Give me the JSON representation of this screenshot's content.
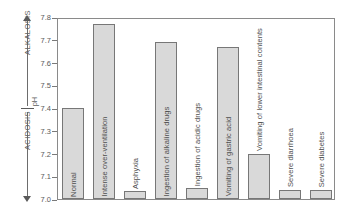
{
  "chart_data": {
    "type": "bar",
    "title": "",
    "xlabel": "",
    "ylabel": "pH",
    "ylim": [
      7.0,
      7.8
    ],
    "ytick_labels": [
      "7.8",
      "7.7",
      "7.6",
      "7.5",
      "7.4",
      "7.3",
      "7.2",
      "7.1",
      "7.0"
    ],
    "ytick_values": [
      7.8,
      7.7,
      7.6,
      7.5,
      7.4,
      7.3,
      7.2,
      7.1,
      7.0
    ],
    "grid": false,
    "legend": "none",
    "categories": [
      "Normal",
      "Intense over-ventilation",
      "Asphyxia",
      "Ingestion of alkaline drugs",
      "Ingestion of acidic drugs",
      "Vomiting of gastric acid",
      "Vomiting of lower intestinal contents",
      "Severe diarrhoea",
      "Severe diabetes"
    ],
    "values": [
      7.4,
      7.77,
      7.035,
      7.69,
      7.048,
      7.67,
      7.2,
      7.04,
      7.04
    ],
    "annotations": {
      "upper_region": "ALKALOSIS",
      "lower_region": "ACIDOSIS",
      "axis_marker": "pH"
    },
    "colors": {
      "bar_fill": "#d9d9d9",
      "bar_border": "#777777",
      "axis": "#8a8a8a",
      "text": "#555555"
    }
  },
  "axis": {
    "ticks": [
      {
        "label": "7.8"
      },
      {
        "label": "7.7"
      },
      {
        "label": "7.6"
      },
      {
        "label": "7.5"
      },
      {
        "label": "7.4"
      },
      {
        "label": "7.3"
      },
      {
        "label": "7.2"
      },
      {
        "label": "7.1"
      },
      {
        "label": "7.0"
      }
    ]
  },
  "annotation": {
    "alkalosis": "ALKALOSIS",
    "acidosis": "ACIDOSIS",
    "ph": "pH"
  },
  "bars": [
    {
      "label": "Normal",
      "value": 7.4
    },
    {
      "label": "Intense over-ventilation",
      "value": 7.77
    },
    {
      "label": "Asphyxia",
      "value": 7.035
    },
    {
      "label": "Ingestion of alkaline drugs",
      "value": 7.69
    },
    {
      "label": "Ingestion of acidic drugs",
      "value": 7.048
    },
    {
      "label": "Vomiting of gastric acid",
      "value": 7.67
    },
    {
      "label": "Vomiting of lower intestinal contents",
      "value": 7.2
    },
    {
      "label": "Severe diarrhoea",
      "value": 7.04
    },
    {
      "label": "Severe diabetes",
      "value": 7.04
    }
  ]
}
